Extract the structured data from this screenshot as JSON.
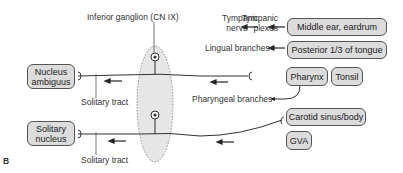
{
  "figure_label": "B",
  "ganglion": {
    "label": "Inferior ganglion (CN IX)"
  },
  "nuclei": [
    {
      "label": "Nucleus ambiguus"
    },
    {
      "label": "Solitary nucleus"
    }
  ],
  "tracts": [
    {
      "label": "Solitary tract"
    },
    {
      "label": "Solitary tract"
    }
  ],
  "branches": {
    "tympanic_nerve": "Tympanic nerve",
    "tympanic_plexus": "Tympanic plexus",
    "lingual": "Lingual branches",
    "pharyngeal": "Pharyngeal branches"
  },
  "targets": [
    {
      "label": "Middle ear, eardrum"
    },
    {
      "label": "Posterior 1/3 of tongue"
    },
    {
      "label": "Pharynx"
    },
    {
      "label": "Tonsil"
    },
    {
      "label": "Carotid sinus/body"
    },
    {
      "label": "GVA"
    }
  ],
  "colors": {
    "box_fill": "#dcdcdc",
    "ganglion_fill": "#e6e6e6",
    "line": "#333333"
  }
}
